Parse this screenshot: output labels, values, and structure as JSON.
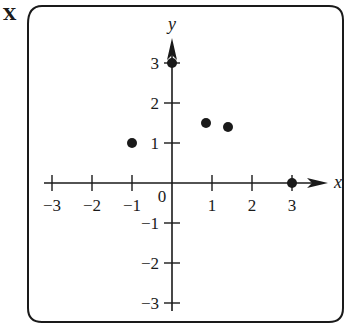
{
  "corner_label": "X",
  "chart_data": {
    "type": "scatter",
    "title": "",
    "xlabel": "x",
    "ylabel": "y",
    "xlim": [
      -3,
      3
    ],
    "ylim": [
      -3,
      3
    ],
    "grid": false,
    "x_ticks": [
      -3,
      -2,
      -1,
      1,
      2,
      3
    ],
    "y_ticks": [
      -3,
      -2,
      -1,
      1,
      2,
      3
    ],
    "x_tick_labels": [
      "-3",
      "-2",
      "-1",
      "1",
      "2",
      "3"
    ],
    "y_tick_labels": [
      "-3",
      "-2",
      "-1",
      "1",
      "2",
      "3"
    ],
    "origin_label": "0",
    "points": [
      {
        "x": -1,
        "y": 1
      },
      {
        "x": 0,
        "y": 3
      },
      {
        "x": 0.85,
        "y": 1.5
      },
      {
        "x": 1.4,
        "y": 1.4
      },
      {
        "x": 3,
        "y": 0
      }
    ],
    "colors": {
      "ink": "#1a1a1a",
      "background": "#ffffff"
    }
  }
}
